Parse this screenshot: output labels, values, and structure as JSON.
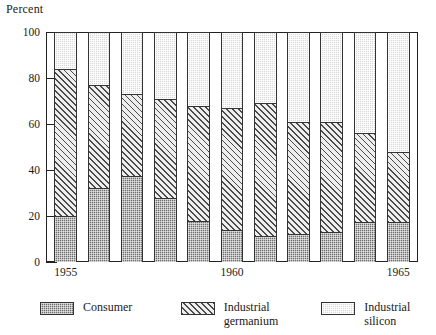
{
  "chart_data": {
    "type": "bar",
    "stacked": true,
    "normalized": true,
    "title": "",
    "ylabel": "Percent",
    "xlabel": "",
    "ylim": [
      0,
      100
    ],
    "yticks": [
      0,
      20,
      40,
      60,
      80,
      100
    ],
    "grid": false,
    "legend_position": "bottom",
    "categories": [
      "1955",
      "1956",
      "1957",
      "1958",
      "1959",
      "1960",
      "1961",
      "1962",
      "1963",
      "1964",
      "1965"
    ],
    "tick_labels": [
      "1955",
      "",
      "",
      "",
      "",
      "1960",
      "",
      "",
      "",
      "",
      "1965"
    ],
    "series": [
      {
        "name": "Consumer",
        "pattern": "checkered-dark",
        "color": "#6e6e6e",
        "values": [
          20,
          32,
          37.5,
          28,
          18,
          14,
          11.5,
          12,
          13,
          17.5,
          17.5
        ]
      },
      {
        "name": "Industrial germanium",
        "pattern": "diagonal-hatch",
        "color": "#eeeeee",
        "values": [
          64,
          45,
          35.5,
          43,
          50,
          53,
          57.5,
          49,
          48,
          38.5,
          30.5
        ]
      },
      {
        "name": "Industrial silicon",
        "pattern": "light-dotted",
        "color": "#d8d8d8",
        "values": [
          16,
          23,
          27,
          29,
          32,
          33,
          31,
          39,
          39,
          44,
          52
        ]
      }
    ],
    "cumulative_tops": {
      "consumer": [
        20,
        32,
        37.5,
        28,
        18,
        14,
        11.5,
        12,
        13,
        17.5,
        17.5
      ],
      "germanium": [
        84,
        77,
        73,
        71,
        68,
        67,
        69,
        61,
        61,
        56,
        48
      ]
    }
  },
  "legend": {
    "items": [
      {
        "label": "Consumer",
        "line2": ""
      },
      {
        "label": "Industrial",
        "line2": "germanium"
      },
      {
        "label": "Industrial silicon",
        "line2": ""
      }
    ]
  }
}
